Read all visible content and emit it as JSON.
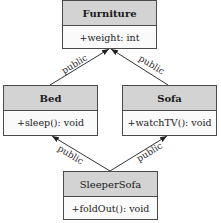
{
  "diagram": {
    "type": "uml-class-inheritance",
    "classes": [
      {
        "id": "furniture",
        "name": "Furniture",
        "bold": true,
        "members": [
          "+weight: int"
        ]
      },
      {
        "id": "bed",
        "name": "Bed",
        "bold": true,
        "members": [
          "+sleep(): void"
        ]
      },
      {
        "id": "sofa",
        "name": "Sofa",
        "bold": true,
        "members": [
          "+watchTV(): void"
        ]
      },
      {
        "id": "sleepersofa",
        "name": "SleeperSofa",
        "bold": false,
        "members": [
          "+foldOut(): void"
        ]
      }
    ],
    "relations": [
      {
        "from": "bed",
        "to": "furniture",
        "label": "public"
      },
      {
        "from": "sofa",
        "to": "furniture",
        "label": "public"
      },
      {
        "from": "sleepersofa",
        "to": "bed",
        "label": "public"
      },
      {
        "from": "sleepersofa",
        "to": "sofa",
        "label": "public"
      }
    ]
  },
  "colors": {
    "header_fill": "#d3d3d3",
    "body_fill": "#fafafa",
    "border": "#4a4a4a"
  }
}
